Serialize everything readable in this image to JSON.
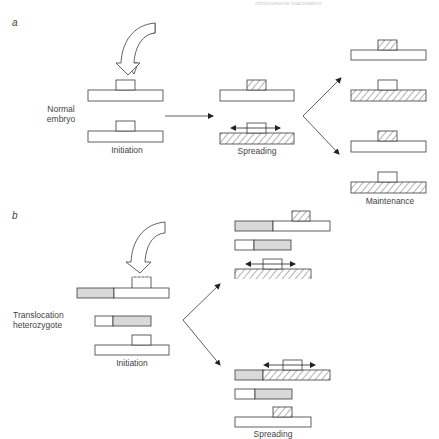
{
  "header": {
    "running_head": "chromosome inactivation"
  },
  "panel_a": {
    "label": "a",
    "row_label_line1": "Normal",
    "row_label_line2": "embryo",
    "stages": [
      "Initiation",
      "Spreading",
      "Maintenance"
    ]
  },
  "panel_b": {
    "label": "b",
    "row_label_line1": "Translocation",
    "row_label_line2": "heterozygote",
    "stages": [
      "Initiation",
      "Spreading"
    ]
  },
  "legend": {
    "hatched": "inactive chromatin",
    "grey": "translocated autosomal segment",
    "box": "inactivation centre"
  },
  "colors": {
    "line": "#3a3a3a",
    "grey_fill": "#d9d9d9",
    "hatch": "#555555",
    "background": "#ffffff"
  }
}
